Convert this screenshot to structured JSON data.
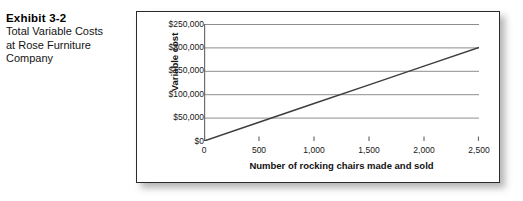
{
  "caption": {
    "exhibit_number": "Exhibit 3-2",
    "lines": [
      "Total Variable Costs",
      "at Rose Furniture",
      "Company"
    ]
  },
  "chart_data": {
    "type": "line",
    "title": "",
    "xlabel": "Number of rocking chairs made and sold",
    "ylabel": "Variable cost",
    "x": [
      0,
      2500
    ],
    "values": [
      0,
      200000
    ],
    "series": [
      {
        "name": "Total variable cost",
        "points": [
          {
            "x": 0,
            "y": 0
          },
          {
            "x": 500,
            "y": 40000
          },
          {
            "x": 1000,
            "y": 80000
          },
          {
            "x": 1500,
            "y": 120000
          },
          {
            "x": 2000,
            "y": 160000
          },
          {
            "x": 2500,
            "y": 200000
          }
        ]
      }
    ],
    "xlim": [
      0,
      2500
    ],
    "ylim": [
      0,
      250000
    ],
    "xticks": [
      0,
      500,
      1000,
      1500,
      2000,
      2500
    ],
    "yticks": [
      0,
      50000,
      100000,
      150000,
      200000,
      250000
    ],
    "xticklabels": [
      "0",
      "500",
      "1,000",
      "1,500",
      "2,000",
      "2,500"
    ],
    "yticklabels": [
      "$0",
      "$50,000",
      "$100,000",
      "$150,000",
      "$200,000",
      "$250,000"
    ],
    "grid": "horizontal",
    "legend": "none",
    "line_color": "#3d3d3d",
    "grid_color": "#8d8d8d",
    "axis_color": "#6e6e6e"
  }
}
